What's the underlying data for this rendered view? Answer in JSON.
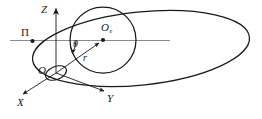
{
  "figure": {
    "kind": "orbital-geometry-diagram",
    "background_color": "#ffffff",
    "stroke_color": "#1a1a1a",
    "axis_color": "#8c8c8c",
    "width": 262,
    "height": 119,
    "labels": {
      "z_axis": "Z",
      "x_axis": "X",
      "y_axis": "Y",
      "origin": "O",
      "body_center": "O",
      "body_center_subscript": "e",
      "perigee": "Π",
      "angle": "θ",
      "radius": "r"
    },
    "shapes": {
      "orbit_ellipse": {
        "name": "orbit",
        "center_x": 141,
        "center_y": 48.5,
        "radius_x": 109,
        "radius_y": 36.5,
        "rotation_deg": -6
      },
      "body_circle": {
        "name": "earth",
        "center_x": 103,
        "center_y": 40,
        "radius": 33
      },
      "origin_ellipse": {
        "name": "origin-marker",
        "center_x": 56,
        "center_y": 73,
        "radius_x": 11,
        "radius_y": 6.5,
        "rotation_deg": -22
      }
    },
    "points": {
      "origin": {
        "x": 56,
        "y": 73
      },
      "body_center": {
        "x": 103,
        "y": 40
      },
      "perigee": {
        "x": 32,
        "y": 41
      }
    },
    "lines": {
      "equatorial_line": {
        "x1": 10,
        "y1": 40,
        "x2": 170,
        "y2": 40
      },
      "z_axis": {
        "x1": 56,
        "y1": 73,
        "x2": 56,
        "y2": 9
      },
      "x_axis": {
        "x1": 56,
        "y1": 73,
        "x2": 22,
        "y2": 95
      },
      "y_axis": {
        "x1": 56,
        "y1": 73,
        "x2": 103,
        "y2": 91
      },
      "radius_vector": {
        "x1": 56,
        "y1": 73,
        "x2": 103,
        "y2": 40
      }
    }
  }
}
